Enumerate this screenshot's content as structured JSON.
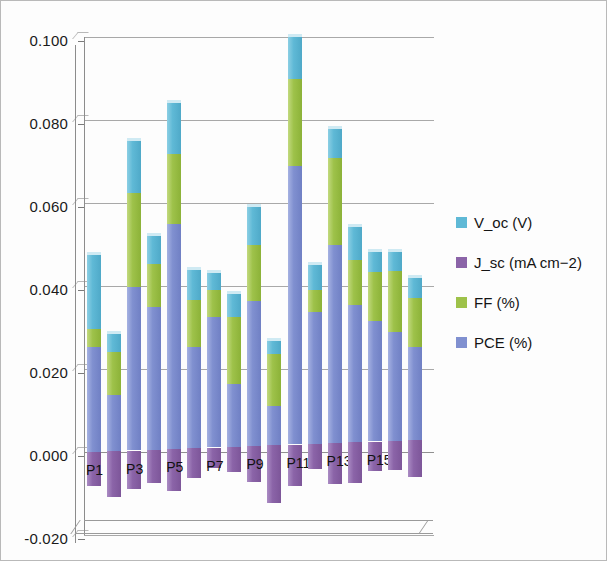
{
  "chart_data": {
    "type": "bar",
    "subtype": "stacked-column-3d",
    "title": "",
    "xlabel": "",
    "ylabel": "",
    "ylim": [
      -0.02,
      0.1
    ],
    "ytick_values": [
      0.1,
      0.08,
      0.06,
      0.04,
      0.02,
      0.0,
      -0.02
    ],
    "ytick_labels": [
      "0.100",
      "0.080",
      "0.060",
      "0.040",
      "0.020",
      "0.000",
      "-0.020"
    ],
    "grid": true,
    "legend_position": "right",
    "categories": [
      "P1",
      "P2",
      "P3",
      "P4",
      "P5",
      "P6",
      "P7",
      "P8",
      "P9",
      "P10",
      "P11",
      "P12",
      "P13",
      "P14",
      "P15",
      "P16",
      "P17"
    ],
    "visible_tick_labels": [
      "P1",
      "P3",
      "P5",
      "P7",
      "P9",
      "P11",
      "P13",
      "P15"
    ],
    "series": [
      {
        "name": "V_oc (V)",
        "color": "#5fb9d6",
        "values": [
          0.0178,
          0.0045,
          0.0125,
          0.0067,
          0.0122,
          0.0072,
          0.0042,
          0.0057,
          0.009,
          0.0032,
          0.0103,
          0.006,
          0.007,
          0.0081,
          0.0048,
          0.0045,
          0.005
        ]
      },
      {
        "name": "J_sc (mA cm-2)",
        "color": "#8b64a8",
        "values": [
          -0.0082,
          -0.011,
          -0.0092,
          -0.008,
          -0.0102,
          -0.0072,
          -0.005,
          -0.006,
          -0.0087,
          -0.014,
          -0.01,
          -0.0062,
          -0.0098,
          -0.0098,
          -0.0072,
          -0.007,
          -0.0088
        ]
      },
      {
        "name": "FF (%)",
        "color": "#9ec24a",
        "values": [
          0.0043,
          0.0103,
          0.0226,
          0.0103,
          0.0168,
          0.0113,
          0.0064,
          0.016,
          0.0135,
          0.0125,
          0.021,
          0.0053,
          0.0208,
          0.0108,
          0.0118,
          0.0148,
          0.0118
        ]
      },
      {
        "name": "PCE (%)",
        "color": "#8090d0",
        "values": [
          0.0254,
          0.0135,
          0.0395,
          0.0344,
          0.0543,
          0.0244,
          0.0315,
          0.0152,
          0.035,
          0.0095,
          0.067,
          0.0318,
          0.0478,
          0.033,
          0.029,
          0.0262,
          0.0223
        ]
      }
    ]
  },
  "legend": {
    "items": [
      {
        "label": "V_oc (V)",
        "color": "#5fb9d6",
        "key": "voc"
      },
      {
        "label": "J_sc (mA cm−2)",
        "color": "#8b64a8",
        "key": "jsc"
      },
      {
        "label": "FF (%)",
        "color": "#9ec24a",
        "key": "ff"
      },
      {
        "label": "PCE (%)",
        "color": "#8090d0",
        "key": "pce"
      }
    ]
  }
}
